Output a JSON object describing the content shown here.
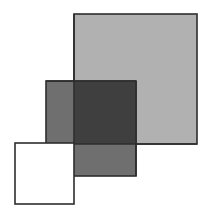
{
  "diagram": {
    "background": "#ffffff",
    "stroke_color": "#2e2e2e",
    "stroke_width": 1.6,
    "shapes": [
      {
        "id": "large-square",
        "x": 74,
        "y": 14,
        "width": 123,
        "height": 130,
        "fill": "#b1b1b1"
      },
      {
        "id": "medium-square",
        "x": 46,
        "y": 81,
        "width": 90,
        "height": 95,
        "fill": "#6f6f6f"
      },
      {
        "id": "overlap-region",
        "x": 74,
        "y": 81,
        "width": 62,
        "height": 63,
        "fill": "#3f3f3f"
      },
      {
        "id": "small-square",
        "x": 15,
        "y": 143,
        "width": 59,
        "height": 61,
        "fill": "#ffffff"
      }
    ]
  }
}
